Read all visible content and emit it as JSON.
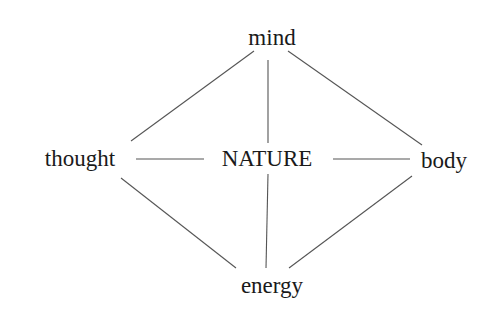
{
  "diagram": {
    "center": {
      "label": "NATURE"
    },
    "nodes": {
      "top": {
        "label": "mind"
      },
      "left": {
        "label": "thought"
      },
      "right": {
        "label": "body"
      },
      "bottom": {
        "label": "energy"
      }
    },
    "edges": [
      [
        "mind",
        "thought"
      ],
      [
        "mind",
        "NATURE"
      ],
      [
        "mind",
        "body"
      ],
      [
        "thought",
        "NATURE"
      ],
      [
        "NATURE",
        "body"
      ],
      [
        "thought",
        "energy"
      ],
      [
        "NATURE",
        "energy"
      ],
      [
        "body",
        "energy"
      ]
    ],
    "colors": {
      "line": "#555555",
      "text": "#1a1a1a",
      "background": "#ffffff"
    }
  }
}
